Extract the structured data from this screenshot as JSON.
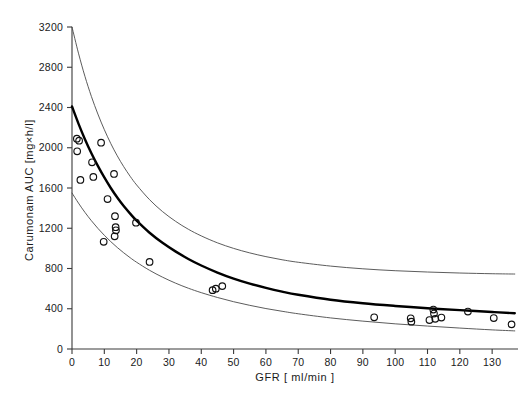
{
  "chart_data": {
    "type": "scatter",
    "title": "",
    "subtitle": "",
    "xlabel": "GFR [ ml/min ]",
    "ylabel": "Carumonam  AUC  [mg×h/l]",
    "xlim": [
      0,
      138
    ],
    "ylim": [
      0,
      3200
    ],
    "xticks": [
      0,
      10,
      20,
      30,
      40,
      50,
      60,
      70,
      80,
      90,
      100,
      110,
      120,
      130
    ],
    "yticks": [
      0,
      400,
      800,
      1200,
      1600,
      2000,
      2400,
      2800,
      3200
    ],
    "xtick_labels": [
      "0",
      "10",
      "20",
      "30",
      "40",
      "50",
      "60",
      "70",
      "80",
      "90",
      "100",
      "110",
      "120",
      "130"
    ],
    "ytick_labels": [
      "0",
      "400",
      "800",
      "1200",
      "1600",
      "2000",
      "2400",
      "2800",
      "3200"
    ],
    "grid": false,
    "legend": null,
    "legend_position": "none",
    "annotations": [],
    "marker": "open-circle",
    "points": [
      {
        "x": 1.5,
        "y": 2090
      },
      {
        "x": 2.2,
        "y": 2070
      },
      {
        "x": 1.6,
        "y": 1965
      },
      {
        "x": 2.6,
        "y": 1680
      },
      {
        "x": 6.2,
        "y": 1855
      },
      {
        "x": 6.6,
        "y": 1710
      },
      {
        "x": 9.0,
        "y": 2050
      },
      {
        "x": 9.8,
        "y": 1065
      },
      {
        "x": 11.0,
        "y": 1490
      },
      {
        "x": 13.0,
        "y": 1740
      },
      {
        "x": 13.3,
        "y": 1320
      },
      {
        "x": 13.5,
        "y": 1210
      },
      {
        "x": 13.6,
        "y": 1180
      },
      {
        "x": 13.2,
        "y": 1120
      },
      {
        "x": 19.8,
        "y": 1255
      },
      {
        "x": 24.0,
        "y": 865
      },
      {
        "x": 43.5,
        "y": 585
      },
      {
        "x": 44.5,
        "y": 600
      },
      {
        "x": 46.5,
        "y": 625
      },
      {
        "x": 93.5,
        "y": 315
      },
      {
        "x": 104.8,
        "y": 305
      },
      {
        "x": 105.0,
        "y": 272
      },
      {
        "x": 110.6,
        "y": 288
      },
      {
        "x": 111.8,
        "y": 392
      },
      {
        "x": 112.0,
        "y": 352
      },
      {
        "x": 112.4,
        "y": 300
      },
      {
        "x": 114.3,
        "y": 313
      },
      {
        "x": 122.5,
        "y": 372
      },
      {
        "x": 130.5,
        "y": 308
      },
      {
        "x": 136.0,
        "y": 245
      }
    ],
    "series": [
      {
        "name": "fitted curve",
        "style": "solid-thick",
        "x": [
          0,
          2,
          4,
          6,
          8,
          10,
          12,
          14,
          16,
          18,
          20,
          24,
          28,
          32,
          36,
          40,
          45,
          50,
          55,
          60,
          65,
          70,
          80,
          90,
          100,
          110,
          120,
          130,
          137
        ],
        "y": [
          2410,
          2240,
          2085,
          1945,
          1820,
          1705,
          1600,
          1505,
          1420,
          1345,
          1275,
          1155,
          1055,
          970,
          895,
          830,
          760,
          700,
          650,
          607,
          570,
          539,
          490,
          455,
          428,
          405,
          386,
          368,
          355
        ]
      },
      {
        "name": "upper confidence band",
        "style": "solid-thin",
        "x": [
          0,
          2,
          4,
          6,
          8,
          10,
          12,
          14,
          16,
          18,
          20,
          24,
          28,
          32,
          36,
          40,
          45,
          50,
          55,
          60,
          65,
          70,
          80,
          90,
          100,
          110,
          120,
          130,
          137
        ],
        "y": [
          3200,
          2940,
          2710,
          2510,
          2335,
          2180,
          2042,
          1920,
          1812,
          1716,
          1630,
          1484,
          1366,
          1270,
          1190,
          1124,
          1055,
          1000,
          955,
          918,
          887,
          862,
          824,
          797,
          778,
          765,
          755,
          748,
          745
        ]
      },
      {
        "name": "lower confidence band",
        "style": "solid-thin",
        "x": [
          0,
          2,
          4,
          6,
          8,
          10,
          12,
          14,
          16,
          18,
          20,
          24,
          28,
          32,
          36,
          40,
          45,
          50,
          55,
          60,
          65,
          70,
          80,
          90,
          100,
          110,
          120,
          130,
          137
        ],
        "y": [
          1550,
          1450,
          1358,
          1275,
          1199,
          1130,
          1067,
          1009,
          956,
          907,
          862,
          782,
          714,
          655,
          604,
          560,
          512,
          470,
          434,
          402,
          375,
          350,
          309,
          277,
          250,
          228,
          208,
          190,
          180
        ]
      }
    ]
  }
}
